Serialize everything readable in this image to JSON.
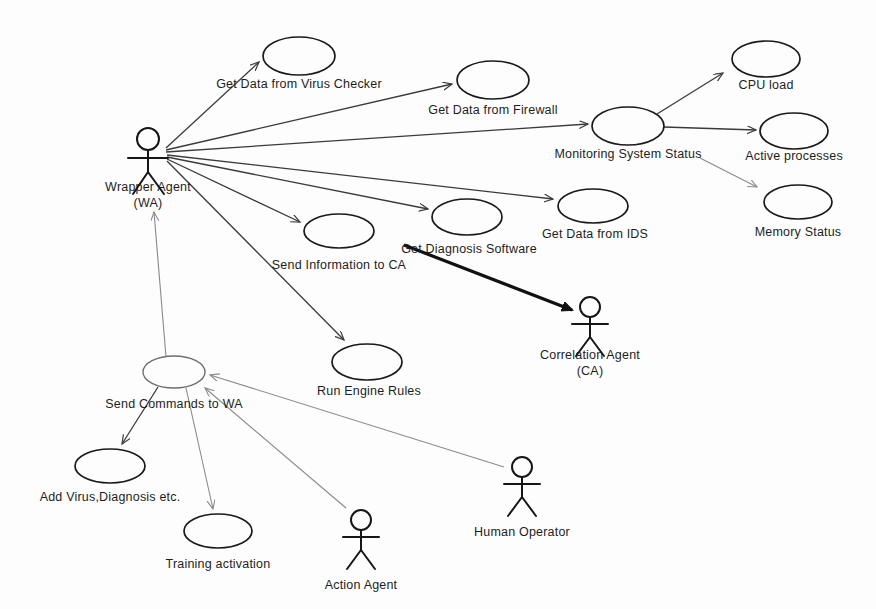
{
  "diagram": {
    "type": "uml-use-case",
    "background_color": "#fdfdfd",
    "stroke_color": "#1a1a1a",
    "actors": [
      {
        "id": "wrapper-agent",
        "label_line1": "Wrapper Agent",
        "label_line2": "(WA)",
        "x": 148,
        "y": 133,
        "label_x": 148,
        "label_y": 186
      },
      {
        "id": "correlation-agent",
        "label_line1": "Correlation Agent",
        "label_line2": "(CA)",
        "x": 590,
        "y": 303,
        "label_x": 590,
        "label_y": 352
      },
      {
        "id": "action-agent",
        "label_line1": "Action Agent",
        "label_line2": "",
        "x": 361,
        "y": 516,
        "label_x": 361,
        "label_y": 565
      },
      {
        "id": "human-operator",
        "label_line1": "Human Operator",
        "label_line2": "",
        "x": 522,
        "y": 463,
        "label_x": 522,
        "label_y": 514
      }
    ],
    "use_cases": [
      {
        "id": "get-data-virus-checker",
        "label": "Get Data from Virus Checker",
        "cx": 299,
        "cy": 56,
        "rx": 36,
        "ry": 19,
        "label_x": 299,
        "label_y": 83,
        "style": "normal"
      },
      {
        "id": "get-data-firewall",
        "label": "Get Data from Firewall",
        "cx": 493,
        "cy": 80,
        "rx": 36,
        "ry": 19,
        "label_x": 493,
        "label_y": 109,
        "style": "normal"
      },
      {
        "id": "monitoring-system-status",
        "label": "Monitoring System Status",
        "cx": 628,
        "cy": 126,
        "rx": 36,
        "ry": 19,
        "label_x": 628,
        "label_y": 152,
        "style": "normal"
      },
      {
        "id": "cpu-load",
        "label": "CPU load",
        "cx": 766,
        "cy": 59,
        "rx": 34,
        "ry": 18,
        "label_x": 766,
        "label_y": 84,
        "style": "normal"
      },
      {
        "id": "active-processes",
        "label": "Active processes",
        "cx": 794,
        "cy": 131,
        "rx": 34,
        "ry": 18,
        "label_x": 794,
        "label_y": 155,
        "style": "normal"
      },
      {
        "id": "memory-status",
        "label": "Memory Status",
        "cx": 798,
        "cy": 202,
        "rx": 34,
        "ry": 17,
        "label_x": 798,
        "label_y": 231,
        "style": "normal"
      },
      {
        "id": "get-data-ids",
        "label": "Get Data from IDS",
        "cx": 593,
        "cy": 206,
        "rx": 35,
        "ry": 17,
        "label_x": 595,
        "label_y": 233,
        "style": "normal"
      },
      {
        "id": "get-diagnosis-software",
        "label": "Get Diagnosis Software",
        "cx": 467,
        "cy": 217,
        "rx": 35,
        "ry": 18,
        "label_x": 469,
        "label_y": 248,
        "style": "normal"
      },
      {
        "id": "send-information-to-ca",
        "label": "Send Information to CA",
        "cx": 339,
        "cy": 231,
        "rx": 35,
        "ry": 17,
        "label_x": 339,
        "label_y": 264,
        "style": "normal"
      },
      {
        "id": "run-engine-rules",
        "label": "Run Engine Rules",
        "cx": 367,
        "cy": 362,
        "rx": 35,
        "ry": 18,
        "label_x": 369,
        "label_y": 390,
        "style": "normal"
      },
      {
        "id": "send-commands-to-wa",
        "label": "Send Commands to WA",
        "cx": 174,
        "cy": 372,
        "rx": 31,
        "ry": 16,
        "label_x": 174,
        "label_y": 403,
        "style": "light"
      },
      {
        "id": "add-virus-diagnosis",
        "label": "Add Virus,Diagnosis etc.",
        "cx": 110,
        "cy": 466,
        "rx": 35,
        "ry": 17,
        "label_x": 110,
        "label_y": 496,
        "style": "normal"
      },
      {
        "id": "training-activation",
        "label": "Training activation",
        "cx": 218,
        "cy": 531,
        "rx": 34,
        "ry": 17,
        "label_x": 218,
        "label_y": 563,
        "style": "normal"
      }
    ],
    "connections": [
      {
        "id": "wa-to-virus-checker",
        "from": "wrapper-agent",
        "to": "get-data-virus-checker",
        "style": "assoc-dark",
        "arrow": true
      },
      {
        "id": "wa-to-firewall",
        "from": "wrapper-agent",
        "to": "get-data-firewall",
        "style": "assoc-dark",
        "arrow": true
      },
      {
        "id": "wa-to-monitoring",
        "from": "wrapper-agent",
        "to": "monitoring-system-status",
        "style": "assoc-dark",
        "arrow": true
      },
      {
        "id": "wa-to-ids",
        "from": "wrapper-agent",
        "to": "get-data-ids",
        "style": "assoc-dark",
        "arrow": true
      },
      {
        "id": "wa-to-diagnosis",
        "from": "wrapper-agent",
        "to": "get-diagnosis-software",
        "style": "assoc-dark",
        "arrow": true
      },
      {
        "id": "wa-to-send-info",
        "from": "wrapper-agent",
        "to": "send-information-to-ca",
        "style": "assoc-dark",
        "arrow": true
      },
      {
        "id": "wa-to-run-engine",
        "from": "wrapper-agent",
        "to": "run-engine-rules",
        "style": "assoc-dark",
        "arrow": true
      },
      {
        "id": "monitoring-to-cpu",
        "from": "monitoring-system-status",
        "to": "cpu-load",
        "style": "assoc-dark",
        "arrow": true
      },
      {
        "id": "monitoring-to-active",
        "from": "monitoring-system-status",
        "to": "active-processes",
        "style": "assoc-dark",
        "arrow": true
      },
      {
        "id": "monitoring-to-memory",
        "from": "monitoring-system-status",
        "to": "memory-status",
        "style": "assoc-faint",
        "arrow": true
      },
      {
        "id": "send-info-to-ca-actor",
        "from": "send-information-to-ca",
        "to": "correlation-agent",
        "style": "assoc-thick",
        "arrow": true
      },
      {
        "id": "send-commands-to-wa-actor",
        "from": "send-commands-to-wa",
        "to": "wrapper-agent",
        "style": "assoc-faint",
        "arrow": true
      },
      {
        "id": "send-commands-to-add-virus",
        "from": "send-commands-to-wa",
        "to": "add-virus-diagnosis",
        "style": "assoc-dark",
        "arrow": true
      },
      {
        "id": "send-commands-to-training",
        "from": "send-commands-to-wa",
        "to": "training-activation",
        "style": "assoc-faint",
        "arrow": true
      },
      {
        "id": "action-agent-to-send-commands",
        "from": "action-agent",
        "to": "send-commands-to-wa",
        "style": "assoc-faint",
        "arrow": true
      },
      {
        "id": "human-operator-to-send-commands",
        "from": "human-operator",
        "to": "send-commands-to-wa",
        "style": "assoc-faint",
        "arrow": true
      }
    ]
  }
}
